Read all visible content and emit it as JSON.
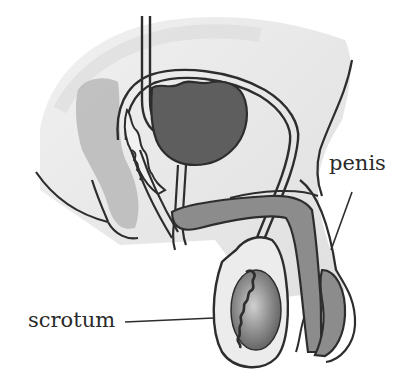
{
  "diagram": {
    "type": "anatomical-illustration",
    "labels": [
      {
        "id": "penis",
        "text": "penis"
      },
      {
        "id": "scrotum",
        "text": "scrotum"
      }
    ],
    "colors": {
      "background": "#ffffff",
      "body_fill": "#e6e6e6",
      "body_shadow": "#d6d6d6",
      "organ_dark": "#5e5e5e",
      "organ_mid": "#8c8c8c",
      "organ_light": "#b9b9b9",
      "outline": "#2d2d2d",
      "label_text": "#2a2a2a"
    }
  }
}
